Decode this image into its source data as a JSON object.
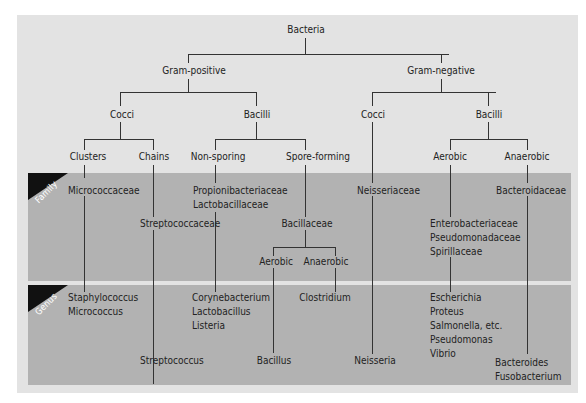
{
  "title": "Bacteria",
  "band_labels": {
    "family": "Family",
    "genus": "Genus"
  },
  "colors": {
    "panel": "#e3e3e3",
    "band": "#b2b2b2",
    "tag": "#111111",
    "line": "#333333"
  },
  "tree": {
    "root": "Bacteria",
    "gram_positive": {
      "label": "Gram-positive",
      "cocci": {
        "label": "Cocci",
        "clusters": {
          "label": "Clusters",
          "family": "Micrococcaceae",
          "genera": [
            "Staphylococcus",
            "Micrococcus"
          ]
        },
        "chains": {
          "label": "Chains",
          "family": "Streptococcaceae",
          "genera": [
            "Streptococcus"
          ]
        }
      },
      "bacilli": {
        "label": "Bacilli",
        "non_sporing": {
          "label": "Non-sporing",
          "families": [
            "Propionibacteriaceae",
            "Lactobacillaceae"
          ],
          "genera": [
            "Corynebacterium",
            "Lactobacillus",
            "Listeria"
          ]
        },
        "spore_forming": {
          "label": "Spore-forming",
          "family": "Bacillaceae",
          "aerobic": {
            "label": "Aerobic",
            "genera": [
              "Bacillus"
            ]
          },
          "anaerobic": {
            "label": "Anaerobic",
            "genera": [
              "Clostridium"
            ]
          }
        }
      }
    },
    "gram_negative": {
      "label": "Gram-negative",
      "cocci": {
        "label": "Cocci",
        "family": "Neisseriaceae",
        "genera": [
          "Neisseria"
        ]
      },
      "bacilli": {
        "label": "Bacilli",
        "aerobic": {
          "label": "Aerobic",
          "families": [
            "Enterobacteriaceae",
            "Pseudomonadaceae",
            "Spirillaceae"
          ],
          "genera": [
            "Escherichia",
            "Proteus",
            "Salmonella, etc.",
            "Pseudomonas",
            "Vibrio"
          ]
        },
        "anaerobic": {
          "label": "Anaerobic",
          "family": "Bacteroidaceae",
          "genera": [
            "Bacteroides",
            "Fusobacterium"
          ]
        }
      }
    }
  }
}
